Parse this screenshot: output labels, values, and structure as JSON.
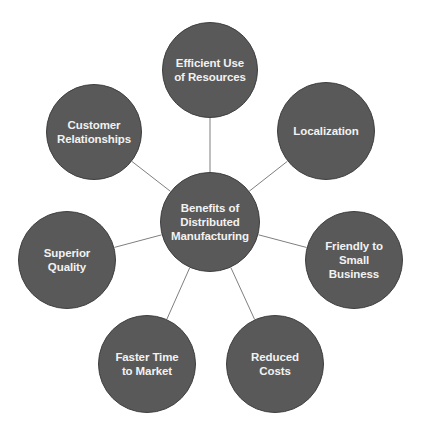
{
  "diagram": {
    "colors": {
      "node_fill": "#595959",
      "node_border": "#3f3f3f",
      "text": "#f2f2f2",
      "connector": "#7f7f7f",
      "background": "#ffffff"
    },
    "center": {
      "label": "Benefits of\nDistributed\nManufacturing",
      "cx": 210,
      "cy": 222,
      "r": 50
    },
    "nodes": [
      {
        "id": "efficient-use-of-resources",
        "label": "Efficient Use\nof Resources",
        "cx": 210,
        "cy": 70,
        "r": 48
      },
      {
        "id": "localization",
        "label": "Localization",
        "cx": 326,
        "cy": 131,
        "r": 49
      },
      {
        "id": "friendly-to-small-business",
        "label": "Friendly to\nSmall\nBusiness",
        "cx": 354,
        "cy": 260,
        "r": 49
      },
      {
        "id": "reduced-costs",
        "label": "Reduced\nCosts",
        "cx": 275,
        "cy": 364,
        "r": 49
      },
      {
        "id": "faster-time-to-market",
        "label": "Faster Time\nto Market",
        "cx": 147,
        "cy": 364,
        "r": 49
      },
      {
        "id": "superior-quality",
        "label": "Superior\nQuality",
        "cx": 67,
        "cy": 260,
        "r": 49
      },
      {
        "id": "customer-relationships",
        "label": "Customer\nRelationships",
        "cx": 94,
        "cy": 132,
        "r": 48
      }
    ]
  }
}
